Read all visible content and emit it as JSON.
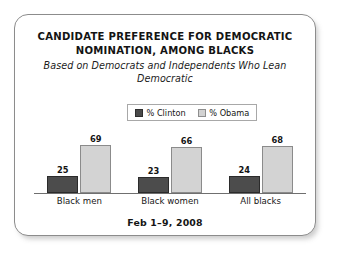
{
  "card": {
    "title_lines": [
      "CANDIDATE PREFERENCE FOR DEMOCRATIC",
      "NOMINATION, AMONG BLACKS"
    ],
    "subtitle": "Based on Democrats and Independents Who Lean Democratic",
    "footer": "Feb 1–9, 2008"
  },
  "legend": {
    "items": [
      {
        "label": "% Clinton",
        "color": "#4c4c4c",
        "swatch_name": "clinton-swatch"
      },
      {
        "label": "% Obama",
        "color": "#d3d3d3",
        "swatch_name": "obama-swatch"
      }
    ]
  },
  "chart_data": {
    "type": "bar",
    "title": "CANDIDATE PREFERENCE FOR DEMOCRATIC NOMINATION, AMONG BLACKS",
    "subtitle": "Based on Democrats and Independents Who Lean Democratic",
    "categories": [
      "Black men",
      "Black women",
      "All blacks"
    ],
    "series": [
      {
        "name": "% Clinton",
        "color": "#4c4c4c",
        "values": [
          25,
          23,
          24
        ]
      },
      {
        "name": "% Obama",
        "color": "#d3d3d3",
        "values": [
          69,
          66,
          68
        ]
      }
    ],
    "xlabel": "",
    "ylabel": "",
    "ylim": [
      0,
      75
    ],
    "grid": false,
    "legend_position": "top-center",
    "annotation": "Feb 1–9, 2008",
    "value_labels": true
  }
}
